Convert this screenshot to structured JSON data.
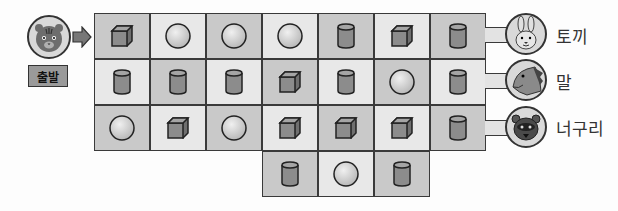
{
  "start": {
    "label": "출발",
    "avatar_icon": "tiger-face-icon",
    "arrow_icon": "arrow-right-icon"
  },
  "grid": {
    "rows": [
      [
        "cube",
        "sphere",
        "sphere",
        "sphere",
        "cylinder",
        "cube",
        "cylinder"
      ],
      [
        "cylinder",
        "cylinder",
        "cylinder",
        "cube",
        "cylinder",
        "sphere",
        "cylinder"
      ],
      [
        "sphere",
        "cube",
        "sphere",
        "cube",
        "cube",
        "cube",
        "cylinder"
      ],
      [
        null,
        null,
        null,
        "cylinder",
        "sphere",
        "cylinder",
        null
      ]
    ],
    "shading": [
      [
        "dark",
        "light",
        "dark",
        "light",
        "dark",
        "light",
        "dark"
      ],
      [
        "light",
        "dark",
        "light",
        "dark",
        "light",
        "dark",
        "light"
      ],
      [
        "dark",
        "light",
        "dark",
        "light",
        "dark",
        "light",
        "dark"
      ],
      [
        null,
        null,
        null,
        "dark",
        "light",
        "dark",
        null
      ]
    ]
  },
  "destinations": [
    {
      "label": "토끼",
      "icon": "rabbit-face-icon"
    },
    {
      "label": "말",
      "icon": "horse-head-icon"
    },
    {
      "label": "너구리",
      "icon": "raccoon-face-icon"
    }
  ],
  "colors": {
    "cell_dark": "#c9c9c9",
    "cell_light": "#e8e8e8",
    "shape_fill": "#8c8c8c",
    "sphere_fill": "#d6d6d6",
    "border": "#3a3a3a"
  }
}
